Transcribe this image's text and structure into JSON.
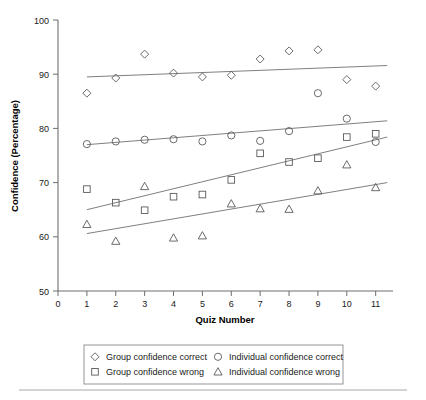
{
  "chart_data": {
    "type": "scatter",
    "title": "",
    "xlabel": "Quiz Number",
    "ylabel": "Confidence (Percentage)",
    "xlim": [
      0,
      11.6
    ],
    "ylim": [
      50,
      100
    ],
    "xticks": [
      "0",
      "1",
      "2",
      "3",
      "4",
      "5",
      "6",
      "7",
      "8",
      "9",
      "10",
      "11"
    ],
    "yticks": [
      "50",
      "60",
      "70",
      "80",
      "90",
      "100"
    ],
    "grid": false,
    "legend_position": "below-plot",
    "x": [
      1,
      2,
      3,
      4,
      5,
      6,
      7,
      8,
      9,
      10,
      11
    ],
    "series": [
      {
        "name": "Group confidence correct",
        "marker": "diamond",
        "values": [
          86.5,
          89.3,
          93.7,
          90.2,
          89.5,
          89.8,
          92.8,
          94.3,
          94.5,
          89.0,
          87.8
        ],
        "trend": {
          "x0": 1,
          "y0": 89.5,
          "x1": 11.4,
          "y1": 91.6
        }
      },
      {
        "name": "Individual confidence correct",
        "marker": "circle",
        "values": [
          77.1,
          77.6,
          77.9,
          78.0,
          77.6,
          78.7,
          77.7,
          79.5,
          86.5,
          81.8,
          77.5
        ],
        "trend": {
          "x0": 1,
          "y0": 77.0,
          "x1": 11.4,
          "y1": 81.4
        }
      },
      {
        "name": "Group confidence wrong",
        "marker": "square",
        "values": [
          68.8,
          66.3,
          64.9,
          67.4,
          67.8,
          70.5,
          75.4,
          73.8,
          74.5,
          78.4,
          79.0
        ],
        "trend": {
          "x0": 1,
          "y0": 65.0,
          "x1": 11.4,
          "y1": 78.4
        }
      },
      {
        "name": "Individual confidence wrong",
        "marker": "triangle",
        "values": [
          62.3,
          59.2,
          69.3,
          59.8,
          60.2,
          66.1,
          65.2,
          65.1,
          68.5,
          73.3,
          69.1
        ],
        "trend": {
          "x0": 1,
          "y0": 60.6,
          "x1": 11.4,
          "y1": 70.0
        }
      }
    ]
  },
  "axes": {
    "y_title": "Confidence (Percentage)",
    "x_title": "Quiz Number",
    "y_tick_labels": [
      "100",
      "90",
      "80",
      "70",
      "60",
      "50"
    ],
    "x_tick_labels": [
      "0",
      "1",
      "2",
      "3",
      "4",
      "5",
      "6",
      "7",
      "8",
      "9",
      "10",
      "11"
    ]
  },
  "legend": {
    "entries": [
      {
        "marker": "diamond",
        "label": "Group confidence correct"
      },
      {
        "marker": "circle",
        "label": "Individual confidence correct"
      },
      {
        "marker": "square",
        "label": "Group confidence wrong"
      },
      {
        "marker": "triangle",
        "label": "Individual confidence wrong"
      }
    ]
  },
  "colors": {
    "marker_stroke": "#5a5a5a",
    "trend_stroke": "#707070",
    "axis": "#6e6e6e",
    "text": "#1a1a1a",
    "background": "#ffffff"
  }
}
